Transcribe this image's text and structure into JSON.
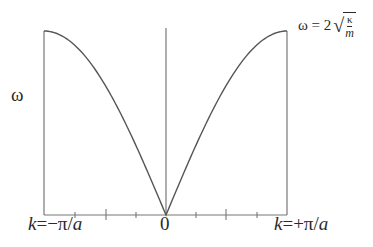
{
  "diagram": {
    "y_axis_label": "ω",
    "x_labels": {
      "left": {
        "prefix": "k",
        "text": "=−π/",
        "suffix": "a"
      },
      "center": "0",
      "right": {
        "prefix": "k",
        "text": "=+π/",
        "suffix": "a"
      }
    },
    "max_annotation": {
      "lhs": "ω = 2",
      "sqrt_symbol": "√",
      "numerator": "κ",
      "denominator": "m"
    },
    "curve": {
      "type": "line",
      "function": "ω = 2√(κ/m)·|sin(ka/2)|",
      "domain": [
        "-π/a",
        "+π/a"
      ],
      "peak_at_edges": true,
      "zero_at_center": true
    },
    "ticks": {
      "count_each_side": 4,
      "major_positions_fraction": [
        -0.5,
        0.5
      ],
      "minor_positions_fraction": [
        -0.75,
        -0.25,
        0.25,
        0.75
      ]
    },
    "colors": {
      "line": "#555555",
      "axis": "#666666",
      "text": "#2a2a2a"
    }
  }
}
